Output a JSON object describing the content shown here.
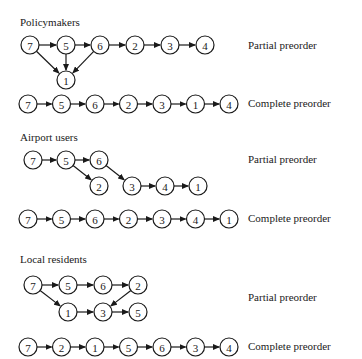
{
  "groups": [
    {
      "title": "Policymakers",
      "partial": {
        "label": "Partial preorder",
        "nodes": [
          {
            "id": "7",
            "x": 30,
            "y": 45
          },
          {
            "id": "5",
            "x": 66,
            "y": 45
          },
          {
            "id": "6",
            "x": 100,
            "y": 45
          },
          {
            "id": "2",
            "x": 135,
            "y": 45
          },
          {
            "id": "3",
            "x": 170,
            "y": 45
          },
          {
            "id": "4",
            "x": 205,
            "y": 45
          },
          {
            "id": "1",
            "x": 66,
            "y": 80
          }
        ],
        "edges": [
          [
            "7",
            "5"
          ],
          [
            "5",
            "6"
          ],
          [
            "6",
            "2"
          ],
          [
            "2",
            "3"
          ],
          [
            "3",
            "4"
          ],
          [
            "7",
            "1"
          ],
          [
            "5",
            "1"
          ],
          [
            "6",
            "1"
          ]
        ]
      },
      "complete": {
        "label": "Complete preorder",
        "order": [
          "7",
          "5",
          "6",
          "2",
          "3",
          "1",
          "4"
        ],
        "y": 104
      }
    },
    {
      "title": "Airport users",
      "partial": {
        "label": "Partial preorder",
        "nodes": [
          {
            "id": "7",
            "x": 33,
            "y": 160
          },
          {
            "id": "5",
            "x": 66,
            "y": 160
          },
          {
            "id": "6",
            "x": 99,
            "y": 160
          },
          {
            "id": "2",
            "x": 99,
            "y": 186
          },
          {
            "id": "3",
            "x": 132,
            "y": 186
          },
          {
            "id": "4",
            "x": 165,
            "y": 186
          },
          {
            "id": "1",
            "x": 198,
            "y": 186
          }
        ],
        "edges": [
          [
            "7",
            "5"
          ],
          [
            "5",
            "6"
          ],
          [
            "5",
            "2"
          ],
          [
            "6",
            "3"
          ],
          [
            "3",
            "4"
          ],
          [
            "4",
            "1"
          ]
        ]
      },
      "complete": {
        "label": "Complete preorder",
        "order": [
          "7",
          "5",
          "6",
          "2",
          "3",
          "4",
          "1"
        ],
        "y": 219
      }
    },
    {
      "title": "Local residents",
      "partial": {
        "label": "Partial preorder",
        "nodes": [
          {
            "id": "7",
            "x": 33,
            "y": 285
          },
          {
            "id": "5",
            "x": 68,
            "y": 285
          },
          {
            "id": "6",
            "x": 103,
            "y": 285
          },
          {
            "id": "2",
            "x": 138,
            "y": 285
          },
          {
            "id": "1",
            "x": 68,
            "y": 312
          },
          {
            "id": "3",
            "x": 103,
            "y": 312
          },
          {
            "id": "5b",
            "text": "5",
            "x": 138,
            "y": 312
          }
        ],
        "edges": [
          [
            "7",
            "5"
          ],
          [
            "5",
            "6"
          ],
          [
            "6",
            "2"
          ],
          [
            "7",
            "1"
          ],
          [
            "1",
            "3"
          ],
          [
            "3",
            "5b"
          ],
          [
            "2",
            "3"
          ]
        ]
      },
      "complete": {
        "label": "Complete preorder",
        "order": [
          "7",
          "2",
          "1",
          "5",
          "6",
          "3",
          "4"
        ],
        "y": 347
      }
    }
  ],
  "layout": {
    "titles_y": [
      16,
      130,
      253
    ],
    "partial_label_y": [
      43,
      159,
      297
    ]
  }
}
